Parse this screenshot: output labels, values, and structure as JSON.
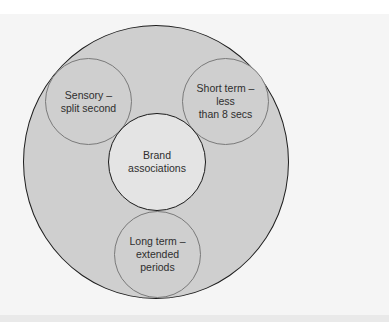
{
  "diagram": {
    "outer": {
      "label": ""
    },
    "center": {
      "label": "Brand\nassociations"
    },
    "nodes": [
      {
        "id": "sensory",
        "label": "Sensory –\nsplit second"
      },
      {
        "id": "short_term",
        "label": "Short term –\nless\nthan 8 secs"
      },
      {
        "id": "long_term",
        "label": "Long term –\nextended\nperiods"
      }
    ]
  },
  "colors": {
    "outer_fill": "#cfcfcf",
    "center_fill": "#e4e4e4",
    "stroke": "#1e1e1e",
    "background": "#f5f5f5"
  }
}
